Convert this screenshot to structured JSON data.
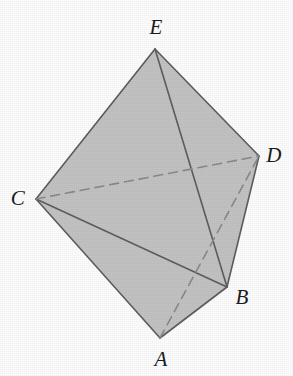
{
  "figure": {
    "shape_type": "bipyramid",
    "background_color": "#fdfdfd",
    "face_fill_color": "#c3c3c3",
    "edge_color": "#5e5e5e",
    "hidden_edge_color": "#8a8a8a",
    "label_color": "#1b1b1b",
    "width": 293,
    "height": 376
  },
  "vertices": [
    {
      "id": "A",
      "label": "A",
      "x": 160,
      "y": 338,
      "label_x": 161,
      "label_y": 359
    },
    {
      "id": "B",
      "label": "B",
      "x": 227,
      "y": 287,
      "label_x": 242,
      "label_y": 297
    },
    {
      "id": "C",
      "label": "C",
      "x": 36,
      "y": 199,
      "label_x": 18,
      "label_y": 198
    },
    {
      "id": "D",
      "label": "D",
      "x": 259,
      "y": 156,
      "label_x": 274,
      "label_y": 155
    },
    {
      "id": "E",
      "label": "E",
      "x": 155,
      "y": 49,
      "label_x": 156,
      "label_y": 27
    }
  ],
  "faces": [
    {
      "id": "face-ECD",
      "vertices": [
        "E",
        "C",
        "D"
      ],
      "fill": "#c3c3c3"
    },
    {
      "id": "face-EDB",
      "vertices": [
        "E",
        "D",
        "B"
      ],
      "fill": "#c3c3c3"
    },
    {
      "id": "face-ECB",
      "vertices": [
        "E",
        "C",
        "B"
      ],
      "fill": "#c3c3c3"
    },
    {
      "id": "face-CAB",
      "vertices": [
        "C",
        "A",
        "B"
      ],
      "fill": "#c3c3c3"
    },
    {
      "id": "face-ABD",
      "vertices": [
        "A",
        "B",
        "D"
      ],
      "fill": "#c3c3c3"
    }
  ],
  "edges": [
    {
      "id": "edge-EC",
      "from": "E",
      "to": "C",
      "style": "solid"
    },
    {
      "id": "edge-ED",
      "from": "E",
      "to": "D",
      "style": "solid"
    },
    {
      "id": "edge-EB",
      "from": "E",
      "to": "B",
      "style": "solid"
    },
    {
      "id": "edge-CB",
      "from": "C",
      "to": "B",
      "style": "solid"
    },
    {
      "id": "edge-CA",
      "from": "C",
      "to": "A",
      "style": "solid"
    },
    {
      "id": "edge-AB",
      "from": "A",
      "to": "B",
      "style": "solid"
    },
    {
      "id": "edge-DB",
      "from": "D",
      "to": "B",
      "style": "solid"
    },
    {
      "id": "edge-CD",
      "from": "C",
      "to": "D",
      "style": "dashed"
    },
    {
      "id": "edge-AD",
      "from": "A",
      "to": "D",
      "style": "dashed"
    }
  ],
  "style": {
    "edge_width": 1.6,
    "hidden_edge_width": 1.6,
    "dash_pattern": "9 6",
    "label_font_size": 21
  }
}
